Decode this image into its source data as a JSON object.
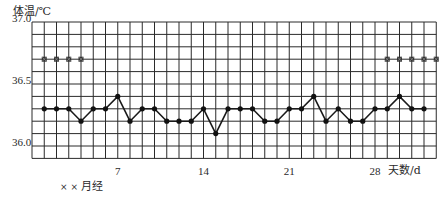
{
  "chart_data": {
    "type": "line",
    "title": "",
    "ylabel": "体温/℃",
    "xlabel": "天数/d",
    "ylim": [
      35.9,
      37.0
    ],
    "xlim": [
      0,
      33
    ],
    "grid": true,
    "y_ticks": [
      {
        "value": 37.0,
        "label": "37.0"
      },
      {
        "value": 36.5,
        "label": "36.5"
      },
      {
        "value": 36.0,
        "label": "36.0"
      }
    ],
    "x_ticks": [
      {
        "value": 7,
        "label": "7"
      },
      {
        "value": 14,
        "label": "14"
      },
      {
        "value": 21,
        "label": "21"
      },
      {
        "value": 28,
        "label": "28"
      }
    ],
    "series": [
      {
        "name": "体温",
        "marker": "dot",
        "x": [
          1,
          2,
          3,
          4,
          5,
          6,
          7,
          8,
          9,
          10,
          11,
          12,
          13,
          14,
          15,
          16,
          17,
          18,
          19,
          20,
          21,
          22,
          23,
          24,
          25,
          26,
          27,
          28,
          29,
          30,
          31,
          32
        ],
        "values": [
          36.3,
          36.3,
          36.3,
          36.2,
          36.3,
          36.3,
          36.4,
          36.2,
          36.3,
          36.3,
          36.2,
          36.2,
          36.2,
          36.3,
          36.1,
          36.3,
          36.3,
          36.3,
          36.2,
          36.2,
          36.3,
          36.3,
          36.4,
          36.2,
          36.3,
          36.2,
          36.2,
          36.3,
          36.3,
          36.4,
          36.3,
          36.3
        ]
      },
      {
        "name": "月经",
        "marker": "x-square",
        "x": [
          1,
          2,
          3,
          4,
          29,
          30,
          31,
          32,
          33
        ],
        "values": [
          36.7,
          36.7,
          36.7,
          36.7,
          36.7,
          36.7,
          36.7,
          36.7,
          36.7
        ]
      }
    ],
    "legend": {
      "symbol": "× ×",
      "label": "月经",
      "position": "bottom-left"
    }
  },
  "labels": {
    "y_axis_title": "体温/℃",
    "x_axis_title": "天数/d",
    "legend_symbol": "× ×",
    "legend_text": "月经"
  },
  "style": {
    "grid_color": "#2b2b2b",
    "line_color": "#1a1a1a",
    "marker_color": "#111111",
    "menses_marker_color": "#333333"
  }
}
